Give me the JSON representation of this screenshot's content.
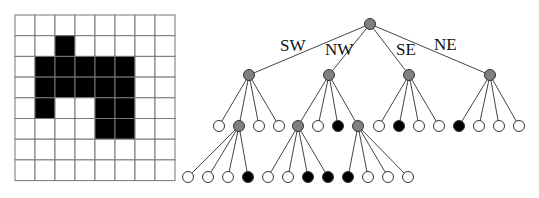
{
  "grid": {
    "rows": 8,
    "cols": 8,
    "origin": [
      15,
      15
    ],
    "cell_w": 20,
    "cell_h": 20.7,
    "filled_color": "#000000",
    "empty_color": "#ffffff",
    "line_color": "#777777",
    "cells": [
      [
        0,
        0,
        0,
        0,
        0,
        0,
        0,
        0
      ],
      [
        0,
        0,
        1,
        0,
        0,
        0,
        0,
        0
      ],
      [
        0,
        1,
        1,
        1,
        1,
        1,
        0,
        0
      ],
      [
        0,
        1,
        1,
        1,
        1,
        1,
        0,
        0
      ],
      [
        0,
        1,
        0,
        0,
        1,
        1,
        0,
        0
      ],
      [
        0,
        0,
        0,
        0,
        1,
        1,
        0,
        0
      ],
      [
        0,
        0,
        0,
        0,
        0,
        0,
        0,
        0
      ],
      [
        0,
        0,
        0,
        0,
        0,
        0,
        0,
        0
      ]
    ]
  },
  "tree": {
    "node_radius": 5.5,
    "colors": {
      "gray": "#808080",
      "black": "#000000",
      "white": "#ffffff",
      "stroke": "#333333",
      "edge": "#444444"
    },
    "labels": [
      {
        "text": "SW",
        "x": 280,
        "y": 51
      },
      {
        "text": "NW",
        "x": 325,
        "y": 55
      },
      {
        "text": "SE",
        "x": 396,
        "y": 55
      },
      {
        "text": "NE",
        "x": 434,
        "y": 50
      }
    ],
    "nodes": [
      {
        "id": "root",
        "x": 370,
        "y": 24,
        "color": "gray",
        "parent": null
      },
      {
        "id": "SW",
        "x": 249,
        "y": 75,
        "color": "gray",
        "parent": "root"
      },
      {
        "id": "NW",
        "x": 329,
        "y": 75,
        "color": "gray",
        "parent": "root"
      },
      {
        "id": "SE",
        "x": 409,
        "y": 75,
        "color": "gray",
        "parent": "root"
      },
      {
        "id": "NE",
        "x": 490,
        "y": 75,
        "color": "gray",
        "parent": "root"
      },
      {
        "id": "SW.0",
        "x": 219,
        "y": 126,
        "color": "white",
        "parent": "SW"
      },
      {
        "id": "SW.1",
        "x": 239,
        "y": 126,
        "color": "gray",
        "parent": "SW"
      },
      {
        "id": "SW.2",
        "x": 259,
        "y": 126,
        "color": "white",
        "parent": "SW"
      },
      {
        "id": "SW.3",
        "x": 279,
        "y": 126,
        "color": "white",
        "parent": "SW"
      },
      {
        "id": "NW.0",
        "x": 298,
        "y": 126,
        "color": "gray",
        "parent": "NW"
      },
      {
        "id": "NW.1",
        "x": 318,
        "y": 126,
        "color": "white",
        "parent": "NW"
      },
      {
        "id": "NW.2",
        "x": 338,
        "y": 126,
        "color": "black",
        "parent": "NW"
      },
      {
        "id": "NW.3",
        "x": 358,
        "y": 126,
        "color": "gray",
        "parent": "NW"
      },
      {
        "id": "SE.0",
        "x": 379,
        "y": 126,
        "color": "white",
        "parent": "SE"
      },
      {
        "id": "SE.1",
        "x": 399,
        "y": 126,
        "color": "black",
        "parent": "SE"
      },
      {
        "id": "SE.2",
        "x": 419,
        "y": 126,
        "color": "white",
        "parent": "SE"
      },
      {
        "id": "SE.3",
        "x": 439,
        "y": 126,
        "color": "white",
        "parent": "SE"
      },
      {
        "id": "NE.0",
        "x": 459,
        "y": 126,
        "color": "black",
        "parent": "NE"
      },
      {
        "id": "NE.1",
        "x": 479,
        "y": 126,
        "color": "white",
        "parent": "NE"
      },
      {
        "id": "NE.2",
        "x": 499,
        "y": 126,
        "color": "white",
        "parent": "NE"
      },
      {
        "id": "NE.3",
        "x": 519,
        "y": 126,
        "color": "white",
        "parent": "NE"
      },
      {
        "id": "SW.1.0",
        "x": 188,
        "y": 177,
        "color": "white",
        "parent": "SW.1"
      },
      {
        "id": "SW.1.1",
        "x": 208,
        "y": 177,
        "color": "white",
        "parent": "SW.1"
      },
      {
        "id": "SW.1.2",
        "x": 228,
        "y": 177,
        "color": "white",
        "parent": "SW.1"
      },
      {
        "id": "SW.1.3",
        "x": 248,
        "y": 177,
        "color": "black",
        "parent": "SW.1"
      },
      {
        "id": "NW.0.0",
        "x": 268,
        "y": 177,
        "color": "white",
        "parent": "NW.0"
      },
      {
        "id": "NW.0.1",
        "x": 288,
        "y": 177,
        "color": "white",
        "parent": "NW.0"
      },
      {
        "id": "NW.0.2",
        "x": 308,
        "y": 177,
        "color": "black",
        "parent": "NW.0"
      },
      {
        "id": "NW.0.3",
        "x": 328,
        "y": 177,
        "color": "black",
        "parent": "NW.0"
      },
      {
        "id": "NW.3.0",
        "x": 348,
        "y": 177,
        "color": "black",
        "parent": "NW.3"
      },
      {
        "id": "NW.3.1",
        "x": 368,
        "y": 177,
        "color": "white",
        "parent": "NW.3"
      },
      {
        "id": "NW.3.2",
        "x": 388,
        "y": 177,
        "color": "white",
        "parent": "NW.3"
      },
      {
        "id": "NW.3.3",
        "x": 408,
        "y": 177,
        "color": "white",
        "parent": "NW.3"
      }
    ]
  }
}
